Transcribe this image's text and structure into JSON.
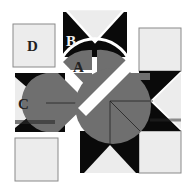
{
  "diagram": {
    "labels": {
      "A": "A",
      "B": "B",
      "C": "C",
      "D": "D"
    },
    "colors": {
      "background": "#ffffff",
      "light": "#ececec",
      "dark": "#0a0a0a",
      "gray": "#6f6f6f",
      "outline": "#8a8a8a",
      "label_dark": "#222222",
      "label_light": "#f2f2f2"
    }
  }
}
